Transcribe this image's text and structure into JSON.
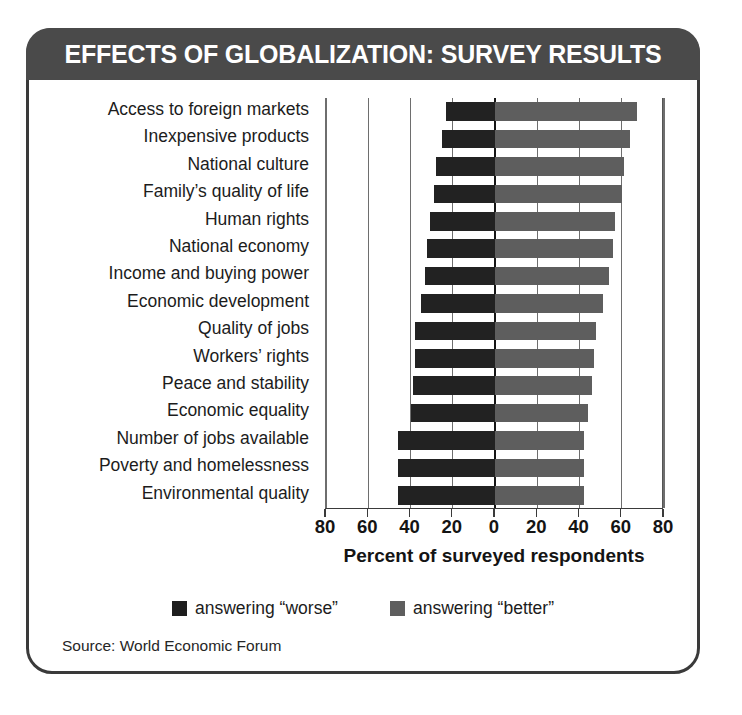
{
  "figure": {
    "title": "EFFECTS OF GLOBALIZATION: SURVEY RESULTS",
    "source": "Source: World Economic Forum",
    "title_bg": "#4a4a4a",
    "frame_color": "#3a3a3a"
  },
  "legend": {
    "position": "bottom-center",
    "items": [
      {
        "label": "answering “worse”",
        "color": "#1e1e1e"
      },
      {
        "label": "answering “better”",
        "color": "#5e5e5e"
      }
    ]
  },
  "chart_data": {
    "type": "bar",
    "orientation": "horizontal",
    "layout": "diverging",
    "title": "EFFECTS OF GLOBALIZATION: SURVEY RESULTS",
    "xlabel": "Percent of surveyed respondents",
    "ylabel": "",
    "xlim": [
      -80,
      80
    ],
    "xticks": [
      -80,
      -60,
      -40,
      -20,
      0,
      20,
      40,
      60,
      80
    ],
    "xticklabels": [
      "80",
      "60",
      "40",
      "20",
      "0",
      "20",
      "40",
      "60",
      "80"
    ],
    "grid": true,
    "categories": [
      "Access to foreign markets",
      "Inexpensive products",
      "National culture",
      "Family’s quality of life",
      "Human rights",
      "National economy",
      "Income and buying power",
      "Economic development",
      "Quality of jobs",
      "Workers’ rights",
      "Peace and stability",
      "Economic equality",
      "Number of jobs available",
      "Poverty and homelessness",
      "Environmental quality"
    ],
    "series": [
      {
        "name": "answering “worse”",
        "color": "#222222",
        "direction": "left",
        "values": [
          23,
          25,
          28,
          29,
          31,
          32,
          33,
          35,
          38,
          38,
          39,
          40,
          46,
          46,
          46
        ]
      },
      {
        "name": "answering “better”",
        "color": "#5e5e5e",
        "direction": "right",
        "values": [
          67,
          64,
          61,
          60,
          57,
          56,
          54,
          51,
          48,
          47,
          46,
          44,
          42,
          42,
          42
        ]
      }
    ]
  }
}
